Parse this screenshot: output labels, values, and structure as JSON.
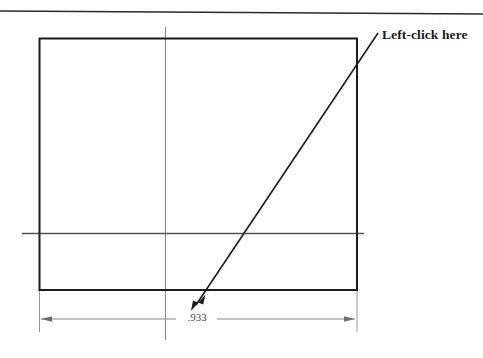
{
  "document": {
    "type": "cad-drawing-figure",
    "background_color": "#ffffff",
    "width": 483,
    "height": 358
  },
  "annotation": {
    "callout_label": "Left-click here",
    "callout_color": "#1a1a1a",
    "leader_start_x": 378,
    "leader_start_y": 33,
    "leader_tip_x": 191,
    "leader_tip_y": 311
  },
  "dimension": {
    "value_label": ".933",
    "line_color": "#8a8a8a",
    "text_color": "#4a4a4a",
    "left_arrow_x": 41,
    "right_arrow_x": 355,
    "line_y": 319
  },
  "geometry": {
    "rectangle": {
      "left": 39,
      "top": 38,
      "right": 357,
      "bottom": 290,
      "stroke_color": "#1c1c1c",
      "stroke_width": 2
    },
    "vertical_centerline": {
      "x": 165,
      "top": 27,
      "bottom": 340,
      "color": "#8a8a8a"
    },
    "horizontal_centerline": {
      "y": 233,
      "left": 22,
      "right": 364,
      "color": "#555555"
    },
    "top_rule": {
      "left_x": 0,
      "left_y": 11,
      "right_x": 483,
      "right_y": 14,
      "color": "#2a2a2a"
    }
  }
}
